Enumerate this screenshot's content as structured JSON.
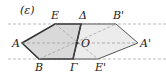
{
  "diagram": {
    "line_label": "(ε)",
    "points": {
      "A": {
        "label": "A",
        "x": 22,
        "y": 43
      },
      "E": {
        "label": "E",
        "x": 55,
        "y": 24
      },
      "D": {
        "label": "Δ",
        "x": 81,
        "y": 24
      },
      "G": {
        "label": "Γ",
        "x": 73,
        "y": 59
      },
      "B": {
        "label": "B",
        "x": 39,
        "y": 59
      },
      "O": {
        "label": "O",
        "x": 77,
        "y": 43
      },
      "Bp": {
        "label": "B'",
        "x": 116,
        "y": 24
      },
      "Ap": {
        "label": "A'",
        "x": 138,
        "y": 43
      },
      "Ep": {
        "label": "E'",
        "x": 98,
        "y": 59
      }
    },
    "colors": {
      "fill_original": "#d9d9d9",
      "fill_image": "#ececec",
      "edge": "#333333",
      "dashed": "#aaaaaa"
    }
  }
}
